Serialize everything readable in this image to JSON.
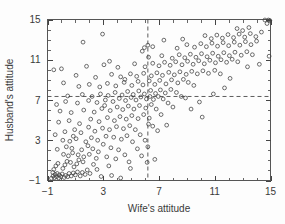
{
  "chart_data": {
    "type": "scatter",
    "title": "",
    "xlabel": "Wife's attitude",
    "ylabel": "Husband's attitude",
    "xlim": [
      -1,
      15
    ],
    "ylim": [
      -1,
      15
    ],
    "xticks": [
      -1,
      3,
      7,
      11,
      15
    ],
    "yticks": [
      -1,
      3,
      7,
      11,
      15
    ],
    "xtick_labels": [
      "−1",
      "3",
      "7",
      "11",
      "15"
    ],
    "ytick_labels": [
      "−1",
      "3",
      "7",
      "11",
      "15"
    ],
    "minor_tick_interval": 1,
    "grid": false,
    "legend": null,
    "frame": "box",
    "tick_direction": "in",
    "marker": "open-circle",
    "marker_color": "#3d3d3d",
    "marker_radius_px": 1.9,
    "reference_lines": [
      {
        "orientation": "vertical",
        "value": 6.2,
        "style": "dashed",
        "color": "#4a4a4a"
      },
      {
        "orientation": "horizontal",
        "value": 7.35,
        "style": "dashed",
        "color": "#4a4a4a"
      }
    ],
    "n_points": 282,
    "points": [
      [
        -0.72,
        -0.78
      ],
      [
        -0.6,
        -0.55
      ],
      [
        -0.5,
        -0.72
      ],
      [
        -0.45,
        -0.4
      ],
      [
        -0.62,
        -0.2
      ],
      [
        -0.35,
        -0.62
      ],
      [
        -0.3,
        -0.3
      ],
      [
        -0.55,
        0.1
      ],
      [
        -0.2,
        -0.75
      ],
      [
        -0.15,
        -0.45
      ],
      [
        -0.4,
        0.45
      ],
      [
        -0.05,
        -0.6
      ],
      [
        0.05,
        -0.35
      ],
      [
        -0.25,
        0.7
      ],
      [
        0.2,
        -0.7
      ],
      [
        0.3,
        -0.5
      ],
      [
        0.1,
        0.2
      ],
      [
        0.45,
        -0.62
      ],
      [
        0.55,
        -0.3
      ],
      [
        0.25,
        0.55
      ],
      [
        0.7,
        -0.55
      ],
      [
        0.85,
        -0.25
      ],
      [
        0.4,
        0.9
      ],
      [
        1.0,
        -0.45
      ],
      [
        1.15,
        -0.15
      ],
      [
        0.65,
        0.8
      ],
      [
        0.9,
        0.35
      ],
      [
        1.35,
        -0.55
      ],
      [
        1.5,
        -0.2
      ],
      [
        1.1,
        0.65
      ],
      [
        1.7,
        -0.4
      ],
      [
        1.25,
        1.05
      ],
      [
        1.85,
        0.05
      ],
      [
        1.55,
        0.85
      ],
      [
        2.05,
        -0.3
      ],
      [
        0.15,
        1.6
      ],
      [
        0.5,
        1.45
      ],
      [
        0.8,
        1.75
      ],
      [
        1.2,
        1.55
      ],
      [
        1.6,
        1.35
      ],
      [
        2.0,
        1.6
      ],
      [
        2.3,
        0.6
      ],
      [
        2.5,
        1.2
      ],
      [
        -0.3,
        2.1
      ],
      [
        0.35,
        2.35
      ],
      [
        0.75,
        2.2
      ],
      [
        1.45,
        2.05
      ],
      [
        1.9,
        2.45
      ],
      [
        2.25,
        2.15
      ],
      [
        2.65,
        1.85
      ],
      [
        0.1,
        3.0
      ],
      [
        0.6,
        2.9
      ],
      [
        1.05,
        3.15
      ],
      [
        1.75,
        2.85
      ],
      [
        2.15,
        3.25
      ],
      [
        2.6,
        3.0
      ],
      [
        3.0,
        2.6
      ],
      [
        3.25,
        1.35
      ],
      [
        3.4,
        0.45
      ],
      [
        2.85,
        -0.6
      ],
      [
        3.6,
        -0.5
      ],
      [
        4.25,
        -0.75
      ],
      [
        3.9,
        1.15
      ],
      [
        3.55,
        2.25
      ],
      [
        4.1,
        2.05
      ],
      [
        4.55,
        1.55
      ],
      [
        4.85,
        0.85
      ],
      [
        3.2,
        3.4
      ],
      [
        3.75,
        3.3
      ],
      [
        4.3,
        3.1
      ],
      [
        4.7,
        3.45
      ],
      [
        5.1,
        2.85
      ],
      [
        5.45,
        2.15
      ],
      [
        5.75,
        1.45
      ],
      [
        -0.45,
        3.55
      ],
      [
        0.25,
        3.85
      ],
      [
        0.95,
        4.05
      ],
      [
        1.4,
        3.75
      ],
      [
        2.4,
        3.9
      ],
      [
        2.95,
        4.2
      ],
      [
        3.45,
        4.05
      ],
      [
        3.95,
        4.35
      ],
      [
        4.45,
        4.15
      ],
      [
        4.9,
        4.45
      ],
      [
        5.3,
        4.05
      ],
      [
        5.65,
        3.55
      ],
      [
        6.0,
        3.0
      ],
      [
        6.2,
        2.35
      ],
      [
        6.15,
        0.8
      ],
      [
        6.25,
        4.6
      ],
      [
        -0.2,
        4.8
      ],
      [
        0.55,
        4.95
      ],
      [
        1.3,
        4.65
      ],
      [
        2.1,
        5.1
      ],
      [
        2.7,
        4.85
      ],
      [
        3.3,
        5.25
      ],
      [
        3.8,
        4.95
      ],
      [
        4.2,
        5.35
      ],
      [
        4.65,
        5.1
      ],
      [
        5.05,
        5.45
      ],
      [
        5.5,
        5.15
      ],
      [
        5.9,
        5.55
      ],
      [
        6.3,
        5.2
      ],
      [
        6.55,
        4.4
      ],
      [
        6.9,
        3.95
      ],
      [
        -0.1,
        5.9
      ],
      [
        0.7,
        5.75
      ],
      [
        1.6,
        6.0
      ],
      [
        2.35,
        5.8
      ],
      [
        2.9,
        6.15
      ],
      [
        3.5,
        5.95
      ],
      [
        4.0,
        6.3
      ],
      [
        4.4,
        6.05
      ],
      [
        4.8,
        6.4
      ],
      [
        5.2,
        6.1
      ],
      [
        5.6,
        6.45
      ],
      [
        6.05,
        6.2
      ],
      [
        6.45,
        6.55
      ],
      [
        6.8,
        6.1
      ],
      [
        7.15,
        5.55
      ],
      [
        0.3,
        6.85
      ],
      [
        1.15,
        6.7
      ],
      [
        1.95,
        6.95
      ],
      [
        2.55,
        6.75
      ],
      [
        3.15,
        7.0
      ],
      [
        3.7,
        6.85
      ],
      [
        4.15,
        7.15
      ],
      [
        4.6,
        6.95
      ],
      [
        5.0,
        7.25
      ],
      [
        5.35,
        7.0
      ],
      [
        5.7,
        7.3
      ],
      [
        6.1,
        7.1
      ],
      [
        6.35,
        7.35
      ],
      [
        6.6,
        7.05
      ],
      [
        6.95,
        7.35
      ],
      [
        7.3,
        7.1
      ],
      [
        7.65,
        6.7
      ],
      [
        8.0,
        6.3
      ],
      [
        -0.35,
        6.55
      ],
      [
        0.45,
        7.4
      ],
      [
        1.5,
        7.55
      ],
      [
        2.2,
        7.35
      ],
      [
        2.8,
        7.6
      ],
      [
        3.35,
        7.45
      ],
      [
        3.85,
        7.75
      ],
      [
        4.35,
        7.5
      ],
      [
        4.75,
        7.85
      ],
      [
        5.15,
        7.55
      ],
      [
        5.55,
        7.9
      ],
      [
        5.95,
        7.6
      ],
      [
        6.4,
        7.95
      ],
      [
        6.75,
        7.65
      ],
      [
        7.1,
        8.0
      ],
      [
        7.45,
        7.7
      ],
      [
        7.85,
        8.05
      ],
      [
        8.25,
        7.75
      ],
      [
        8.6,
        7.35
      ],
      [
        1.25,
        8.35
      ],
      [
        2.0,
        8.55
      ],
      [
        2.75,
        8.3
      ],
      [
        3.3,
        8.65
      ],
      [
        3.9,
        8.4
      ],
      [
        4.5,
        8.75
      ],
      [
        5.05,
        8.45
      ],
      [
        5.5,
        8.85
      ],
      [
        5.85,
        8.5
      ],
      [
        6.3,
        8.9
      ],
      [
        6.7,
        8.55
      ],
      [
        7.05,
        8.95
      ],
      [
        7.5,
        8.6
      ],
      [
        7.9,
        9.0
      ],
      [
        8.35,
        8.7
      ],
      [
        8.75,
        9.05
      ],
      [
        9.1,
        8.75
      ],
      [
        9.5,
        8.45
      ],
      [
        1.05,
        9.45
      ],
      [
        2.45,
        9.25
      ],
      [
        3.6,
        9.55
      ],
      [
        4.25,
        9.3
      ],
      [
        4.95,
        9.6
      ],
      [
        5.4,
        9.35
      ],
      [
        5.9,
        9.65
      ],
      [
        6.45,
        9.4
      ],
      [
        6.85,
        9.7
      ],
      [
        7.25,
        9.45
      ],
      [
        7.7,
        9.75
      ],
      [
        8.1,
        9.5
      ],
      [
        8.5,
        9.8
      ],
      [
        8.95,
        9.55
      ],
      [
        9.35,
        9.85
      ],
      [
        9.75,
        9.6
      ],
      [
        10.15,
        9.9
      ],
      [
        10.55,
        9.65
      ],
      [
        11.0,
        9.95
      ],
      [
        11.4,
        9.6
      ],
      [
        0.0,
        10.1
      ],
      [
        1.8,
        10.35
      ],
      [
        3.05,
        10.5
      ],
      [
        4.05,
        10.25
      ],
      [
        5.25,
        10.6
      ],
      [
        6.0,
        10.3
      ],
      [
        6.55,
        10.65
      ],
      [
        7.0,
        10.4
      ],
      [
        7.4,
        10.75
      ],
      [
        7.8,
        10.45
      ],
      [
        8.2,
        10.8
      ],
      [
        8.65,
        10.5
      ],
      [
        9.05,
        10.85
      ],
      [
        9.45,
        10.55
      ],
      [
        9.85,
        10.9
      ],
      [
        10.25,
        10.6
      ],
      [
        10.65,
        10.95
      ],
      [
        11.05,
        10.7
      ],
      [
        11.45,
        11.0
      ],
      [
        11.85,
        10.75
      ],
      [
        12.25,
        11.05
      ],
      [
        12.65,
        10.8
      ],
      [
        3.45,
        10.85
      ],
      [
        6.25,
        11.25
      ],
      [
        7.2,
        11.4
      ],
      [
        7.95,
        11.15
      ],
      [
        8.45,
        11.5
      ],
      [
        8.85,
        11.2
      ],
      [
        9.25,
        11.55
      ],
      [
        9.65,
        11.25
      ],
      [
        10.05,
        11.6
      ],
      [
        10.45,
        11.3
      ],
      [
        10.85,
        11.65
      ],
      [
        11.25,
        11.35
      ],
      [
        11.65,
        11.7
      ],
      [
        12.05,
        11.4
      ],
      [
        12.45,
        11.75
      ],
      [
        12.9,
        11.45
      ],
      [
        13.3,
        11.8
      ],
      [
        13.7,
        11.5
      ],
      [
        14.9,
        11.35
      ],
      [
        5.95,
        12.2
      ],
      [
        6.2,
        12.45
      ],
      [
        6.55,
        12.3
      ],
      [
        8.3,
        12.15
      ],
      [
        9.0,
        12.5
      ],
      [
        9.55,
        12.25
      ],
      [
        10.0,
        12.6
      ],
      [
        10.4,
        12.3
      ],
      [
        10.8,
        12.65
      ],
      [
        11.2,
        12.35
      ],
      [
        11.6,
        12.7
      ],
      [
        12.0,
        12.4
      ],
      [
        12.4,
        12.75
      ],
      [
        12.8,
        12.45
      ],
      [
        13.2,
        12.8
      ],
      [
        13.6,
        12.5
      ],
      [
        14.0,
        12.85
      ],
      [
        2.95,
        13.55
      ],
      [
        1.55,
        12.75
      ],
      [
        10.3,
        13.4
      ],
      [
        10.75,
        13.1
      ],
      [
        11.15,
        13.45
      ],
      [
        11.55,
        13.15
      ],
      [
        11.95,
        13.5
      ],
      [
        12.35,
        13.2
      ],
      [
        12.75,
        13.55
      ],
      [
        13.15,
        13.25
      ],
      [
        13.55,
        13.6
      ],
      [
        13.95,
        13.3
      ],
      [
        12.6,
        14.1
      ],
      [
        13.0,
        13.9
      ],
      [
        13.45,
        14.2
      ],
      [
        14.35,
        13.75
      ],
      [
        14.85,
        14.95
      ],
      [
        14.6,
        14.95
      ],
      [
        14.95,
        14.9
      ],
      [
        14.75,
        14.6
      ],
      [
        -0.55,
        10.0
      ],
      [
        0.15,
        8.7
      ],
      [
        9.9,
        6.8
      ],
      [
        10.1,
        5.3
      ],
      [
        8.9,
        7.2
      ],
      [
        7.55,
        4.5
      ],
      [
        6.7,
        1.1
      ],
      [
        4.95,
        0.2
      ],
      [
        2.55,
        0.1
      ],
      [
        1.95,
        4.3
      ],
      [
        0.85,
        3.4
      ],
      [
        3.1,
        6.45
      ],
      [
        5.8,
        11.85
      ],
      [
        4.55,
        9.05
      ],
      [
        7.35,
        12.95
      ],
      [
        8.7,
        13.05
      ],
      [
        9.3,
        6.1
      ],
      [
        12.1,
        9.15
      ],
      [
        13.35,
        10.3
      ],
      [
        14.2,
        10.55
      ],
      [
        11.7,
        8.2
      ],
      [
        10.9,
        7.6
      ]
    ]
  }
}
